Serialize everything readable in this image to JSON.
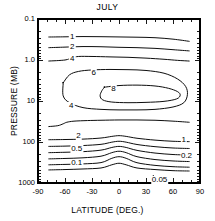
{
  "chart_data": {
    "type": "line",
    "title": "JULY",
    "xlabel": "LATITUDE (DEG.)",
    "ylabel": "PRESSURE (MB)",
    "xlim": [
      -90,
      90
    ],
    "ylim": [
      1000,
      0.1
    ],
    "yscale": "log",
    "yinverted": true,
    "grid": false,
    "legend": "none",
    "xticks": [
      -90,
      -60,
      -30,
      0,
      30,
      60,
      90
    ],
    "xticklabels": [
      "-90",
      "-60",
      "-30",
      "0",
      "30",
      "60",
      "90"
    ],
    "xminortick_step": 10,
    "yticks": [
      0.1,
      1.0,
      10,
      100,
      1000
    ],
    "yticklabels": [
      "0.1",
      "1.0",
      "10",
      "100",
      "1000"
    ],
    "contour_levels": [
      0.05,
      0.1,
      0.2,
      0.5,
      1,
      2,
      4,
      6,
      8
    ],
    "contour_labels": [
      {
        "text": "1",
        "x": -52,
        "y": 0.27
      },
      {
        "text": "2",
        "x": -52,
        "y": 0.47
      },
      {
        "text": "4",
        "x": -52,
        "y": 0.93
      },
      {
        "text": "6",
        "x": -28,
        "y": 2.1
      },
      {
        "text": "8",
        "x": -6,
        "y": 5.2
      },
      {
        "text": "4",
        "x": -53,
        "y": 13.5
      },
      {
        "text": "2",
        "x": -45,
        "y": 72
      },
      {
        "text": "0.5",
        "x": -47,
        "y": 150
      },
      {
        "text": "0.1",
        "x": -47,
        "y": 330
      },
      {
        "text": "1",
        "x": 72,
        "y": 88
      },
      {
        "text": "0.2",
        "x": 75,
        "y": 215
      },
      {
        "text": "0.05",
        "x": 45,
        "y": 830
      }
    ],
    "series": [
      {
        "name": "0.05",
        "points": [
          [
            -78,
            480
          ],
          [
            -60,
            470
          ],
          [
            -40,
            455
          ],
          [
            -20,
            430
          ],
          [
            -8,
            360
          ],
          [
            0,
            330
          ],
          [
            8,
            360
          ],
          [
            20,
            430
          ],
          [
            40,
            470
          ],
          [
            60,
            500
          ],
          [
            78,
            510
          ]
        ]
      },
      {
        "name": "0.1",
        "points": [
          [
            -78,
            360
          ],
          [
            -60,
            352
          ],
          [
            -40,
            342
          ],
          [
            -20,
            318
          ],
          [
            -8,
            250
          ],
          [
            0,
            228
          ],
          [
            8,
            250
          ],
          [
            20,
            320
          ],
          [
            40,
            372
          ],
          [
            60,
            400
          ],
          [
            78,
            412
          ]
        ]
      },
      {
        "name": "0.2",
        "points": [
          [
            -78,
            258
          ],
          [
            -60,
            252
          ],
          [
            -40,
            243
          ],
          [
            -20,
            222
          ],
          [
            -8,
            182
          ],
          [
            0,
            168
          ],
          [
            8,
            182
          ],
          [
            20,
            228
          ],
          [
            40,
            268
          ],
          [
            60,
            290
          ],
          [
            78,
            300
          ]
        ]
      },
      {
        "name": "0.5",
        "points": [
          [
            -78,
            182
          ],
          [
            -60,
            178
          ],
          [
            -40,
            172
          ],
          [
            -20,
            158
          ],
          [
            -8,
            136
          ],
          [
            0,
            128
          ],
          [
            8,
            136
          ],
          [
            20,
            160
          ],
          [
            40,
            186
          ],
          [
            60,
            202
          ],
          [
            78,
            208
          ]
        ]
      },
      {
        "name": "1",
        "points": [
          [
            -78,
            128
          ],
          [
            -60,
            126
          ],
          [
            -40,
            122
          ],
          [
            -20,
            114
          ],
          [
            -8,
            101
          ],
          [
            0,
            96
          ],
          [
            8,
            101
          ],
          [
            20,
            115
          ],
          [
            40,
            130
          ],
          [
            60,
            140
          ],
          [
            78,
            144
          ]
        ]
      },
      {
        "name": "2",
        "points": [
          [
            -78,
            88
          ],
          [
            -60,
            87
          ],
          [
            -40,
            85
          ],
          [
            -20,
            80
          ],
          [
            -8,
            73
          ],
          [
            0,
            70
          ],
          [
            8,
            73
          ],
          [
            20,
            81
          ],
          [
            40,
            90
          ],
          [
            60,
            96
          ],
          [
            78,
            98
          ]
        ]
      },
      {
        "name": "4-lower",
        "points": [
          [
            -78,
            42
          ],
          [
            -68,
            40
          ],
          [
            -62,
            36
          ],
          [
            -58,
            33
          ],
          [
            -50,
            31
          ],
          [
            -35,
            30
          ],
          [
            -20,
            29.5
          ],
          [
            0,
            29
          ],
          [
            20,
            29
          ],
          [
            40,
            29.5
          ],
          [
            60,
            31
          ],
          [
            78,
            33
          ]
        ]
      },
      {
        "name": "6-closed",
        "points": [
          [
            -62,
            3.6
          ],
          [
            -55,
            2.3
          ],
          [
            -45,
            1.9
          ],
          [
            -30,
            1.75
          ],
          [
            -10,
            1.7
          ],
          [
            10,
            1.72
          ],
          [
            30,
            1.8
          ],
          [
            50,
            2.1
          ],
          [
            65,
            2.9
          ],
          [
            74,
            4.4
          ],
          [
            76,
            7.0
          ],
          [
            72,
            11
          ],
          [
            60,
            14
          ],
          [
            40,
            16
          ],
          [
            20,
            16.5
          ],
          [
            0,
            16.5
          ],
          [
            -20,
            16
          ],
          [
            -40,
            14.5
          ],
          [
            -55,
            11
          ],
          [
            -62,
            7.5
          ],
          [
            -62,
            3.6
          ]
        ]
      },
      {
        "name": "8-closed",
        "points": [
          [
            -16,
            4.6
          ],
          [
            0,
            4.2
          ],
          [
            20,
            4.1
          ],
          [
            40,
            4.3
          ],
          [
            55,
            4.9
          ],
          [
            65,
            5.9
          ],
          [
            68,
            7.2
          ],
          [
            64,
            8.9
          ],
          [
            50,
            10.2
          ],
          [
            30,
            10.8
          ],
          [
            10,
            11
          ],
          [
            -8,
            10.6
          ],
          [
            -18,
            9.4
          ],
          [
            -21,
            7.5
          ],
          [
            -19,
            5.6
          ],
          [
            -16,
            4.6
          ]
        ]
      },
      {
        "name": "4-upper",
        "points": [
          [
            -78,
            1.06
          ],
          [
            -60,
            1.0
          ],
          [
            -52,
            0.88
          ],
          [
            -45,
            0.82
          ],
          [
            -30,
            0.82
          ],
          [
            -10,
            0.84
          ],
          [
            10,
            0.86
          ],
          [
            30,
            0.9
          ],
          [
            50,
            0.96
          ],
          [
            65,
            1.02
          ],
          [
            78,
            1.06
          ]
        ]
      },
      {
        "name": "2-upper",
        "points": [
          [
            -78,
            0.5
          ],
          [
            -60,
            0.485
          ],
          [
            -40,
            0.47
          ],
          [
            -20,
            0.475
          ],
          [
            0,
            0.49
          ],
          [
            20,
            0.5
          ],
          [
            40,
            0.52
          ],
          [
            60,
            0.56
          ],
          [
            78,
            0.6
          ]
        ]
      },
      {
        "name": "1-upper",
        "points": [
          [
            -78,
            0.275
          ],
          [
            -60,
            0.272
          ],
          [
            -40,
            0.268
          ],
          [
            -20,
            0.27
          ],
          [
            0,
            0.274
          ],
          [
            20,
            0.278
          ],
          [
            40,
            0.286
          ],
          [
            60,
            0.31
          ],
          [
            78,
            0.35
          ]
        ]
      }
    ]
  },
  "axis": {
    "title": "JULY",
    "xlabel": "LATITUDE (DEG.)",
    "ylabel": "PRESSURE (MB)"
  }
}
